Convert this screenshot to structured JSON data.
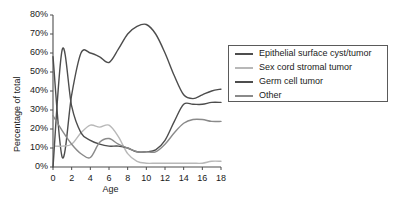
{
  "chart_data": {
    "type": "line",
    "title": "",
    "xlabel": "Age",
    "ylabel": "Percentage of total",
    "xlim": [
      0,
      18
    ],
    "ylim": [
      0,
      80
    ],
    "grid": false,
    "legend_position": "right",
    "x_ticks": [
      "0",
      "2",
      "4",
      "6",
      "8",
      "10",
      "12",
      "14",
      "16",
      "18"
    ],
    "x_tick_values": [
      0,
      2,
      4,
      6,
      8,
      10,
      12,
      14,
      16,
      18
    ],
    "y_ticks": [
      "0%",
      "10%",
      "20%",
      "30%",
      "40%",
      "50%",
      "60%",
      "70%",
      "80%"
    ],
    "y_tick_values": [
      0,
      10,
      20,
      30,
      40,
      50,
      60,
      70,
      80
    ],
    "x": [
      0,
      1,
      2,
      3,
      4,
      5,
      6,
      7,
      8,
      9,
      10,
      11,
      12,
      13,
      14,
      15,
      16,
      17,
      18
    ],
    "series": [
      {
        "name": "Epithelial surface cyst/tumor",
        "color": "#4d4d4d",
        "values": [
          58,
          5,
          38,
          60,
          60,
          58,
          55,
          62,
          70,
          74,
          75,
          70,
          60,
          48,
          38,
          36,
          38,
          40,
          41
        ]
      },
      {
        "name": "Sex cord stromal tumor",
        "color": "#b8b8b8",
        "values": [
          11,
          11,
          12,
          18,
          22,
          21,
          22,
          16,
          7,
          3,
          2,
          2,
          2,
          2,
          2,
          2,
          2,
          3,
          3
        ]
      },
      {
        "name": "Germ cell tumor",
        "color": "#4d4d4d",
        "values": [
          0,
          62,
          32,
          18,
          14,
          12,
          11,
          11,
          10,
          8,
          8,
          9,
          14,
          24,
          33,
          33,
          33,
          34,
          34
        ]
      },
      {
        "name": "Other",
        "color": "#8a8a8a",
        "values": [
          27,
          19,
          12,
          7,
          5,
          13,
          15,
          12,
          10,
          8,
          8,
          8,
          12,
          18,
          23,
          25,
          25,
          24,
          24
        ]
      }
    ]
  }
}
